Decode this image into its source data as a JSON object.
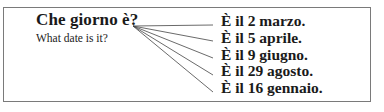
{
  "question": "Che giorno è?",
  "translation": "What date is it?",
  "answers": [
    "È il 2 marzo.",
    "È il 5 aprile.",
    "È il 9 giugno.",
    "È il 29 agosto.",
    "È il 16 gennaio."
  ],
  "colors": {
    "text": "#1a1a1a",
    "border": "#7a7a7a",
    "lines": "#444444"
  }
}
